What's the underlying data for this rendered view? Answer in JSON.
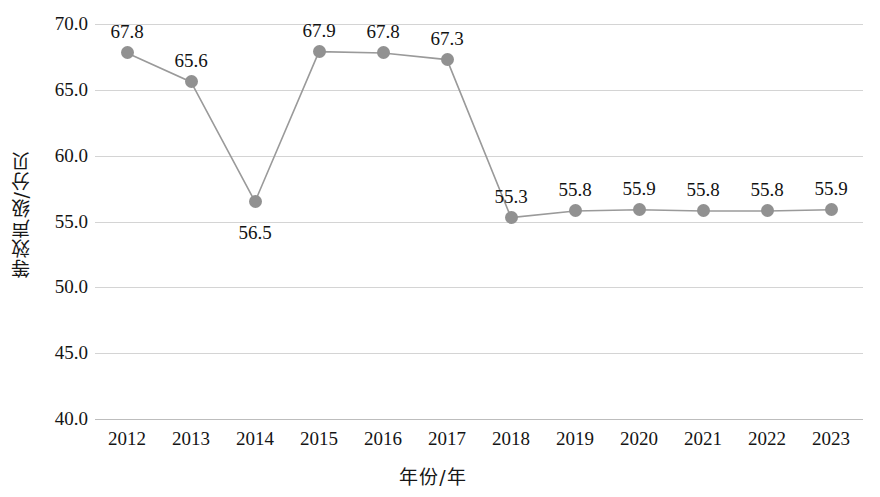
{
  "chart_data": {
    "type": "line",
    "title": "",
    "subtitle": "",
    "xlabel": "年份/年",
    "ylabel": "等效声级/分贝",
    "categories": [
      "2012",
      "2013",
      "2014",
      "2015",
      "2016",
      "2017",
      "2018",
      "2019",
      "2020",
      "2021",
      "2022",
      "2023"
    ],
    "values": [
      67.8,
      65.6,
      56.5,
      67.9,
      67.8,
      67.3,
      55.3,
      55.8,
      55.9,
      55.8,
      55.8,
      55.9
    ],
    "data_labels": [
      "67.8",
      "65.6",
      "56.5",
      "67.9",
      "67.8",
      "67.3",
      "55.3",
      "55.8",
      "55.9",
      "55.8",
      "55.8",
      "55.9"
    ],
    "label_positions": [
      "above",
      "above",
      "below",
      "above",
      "above",
      "above",
      "above",
      "above",
      "above",
      "above",
      "above",
      "above"
    ],
    "series": [
      {
        "name": "等效声级",
        "values": [
          67.8,
          65.6,
          56.5,
          67.9,
          67.8,
          67.3,
          55.3,
          55.8,
          55.9,
          55.8,
          55.8,
          55.9
        ]
      }
    ],
    "ylim": [
      40.0,
      70.0
    ],
    "ytick_labels": [
      "70.0",
      "65.0",
      "60.0",
      "55.0",
      "50.0",
      "45.0",
      "40.0"
    ],
    "ytick_values": [
      70.0,
      65.0,
      60.0,
      55.0,
      50.0,
      45.0,
      40.0
    ],
    "grid": "horizontal",
    "legend": "none",
    "colors": {
      "marker": "#919191",
      "line": "#9a9a9a",
      "gridline": "#d4d4d4",
      "text": "#141414",
      "background": "#ffffff"
    }
  }
}
